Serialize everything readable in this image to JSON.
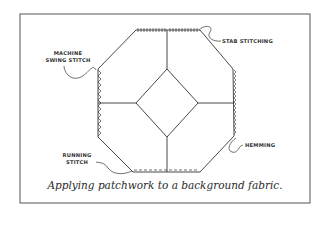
{
  "figure": {
    "caption": "Applying patchwork to a background fabric.",
    "labels": {
      "machine_swing_stitch_line1": "MACHINE",
      "machine_swing_stitch_line2": "SWING STITCH",
      "stab_stitching": "STAB STITCHING",
      "hemming": "HEMMING",
      "running_stitch_line1": "RUNNING",
      "running_stitch_line2": "STITCH"
    },
    "colors": {
      "line": "#333333",
      "frame": "#555555",
      "background": "#ffffff"
    }
  }
}
